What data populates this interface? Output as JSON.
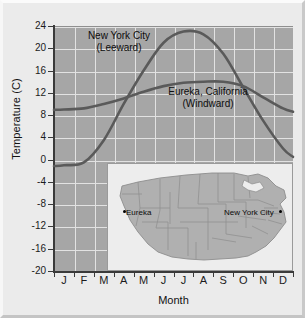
{
  "chart_data": {
    "type": "line",
    "title": "",
    "xlabel": "Month",
    "ylabel": "Temperature (C)",
    "ylim": [
      -20,
      24
    ],
    "yticks": [
      24,
      20,
      16,
      12,
      8,
      4,
      0,
      -4,
      -8,
      -12,
      -16,
      -20
    ],
    "ytick_labels": [
      "24",
      "20",
      "16",
      "12",
      "8",
      "4",
      "0",
      "-4",
      "-8",
      "-12",
      "-16",
      "-20"
    ],
    "categories": [
      "J",
      "F",
      "M",
      "A",
      "M",
      "J",
      "J",
      "A",
      "S",
      "O",
      "N",
      "D"
    ],
    "grid": true,
    "legend": "inline-annotations",
    "series": [
      {
        "name": "New York City",
        "sublabel": "(Leeward)",
        "label_full": "New York City (Leeward)",
        "color": "#5a5a5a",
        "values": [
          -1,
          -0.5,
          3.5,
          10,
          16,
          21,
          23,
          22.5,
          19,
          13,
          7,
          2
        ]
      },
      {
        "name": "Eureka, California",
        "sublabel": "(Windward)",
        "label_full": "Eureka, California (Windward)",
        "color": "#5a5a5a",
        "values": [
          9,
          9.2,
          10,
          11,
          12.2,
          13.2,
          13.8,
          14,
          14,
          13.2,
          11.2,
          9.2
        ]
      }
    ],
    "plot_background": "#a6a6a6",
    "gridline_color": "#e2e2e2",
    "figure_background": "#ebebeb"
  },
  "axes": {
    "y_title": "Temperature (C)",
    "x_title": "Month"
  },
  "annotations": {
    "nyc_line1": "New York City",
    "nyc_line2": "(Leeward)",
    "eureka_line1": "Eureka, California",
    "eureka_line2": "(Windward)"
  },
  "inset_map": {
    "region": "United States",
    "cities": [
      {
        "name": "Eureka",
        "side": "left"
      },
      {
        "name": "New York City",
        "side": "right"
      }
    ],
    "eureka_label": "Eureka",
    "nyc_label": "New York City",
    "background": "#ededed",
    "land_color": "#b0b0b0",
    "border_color": "#8d8d8d"
  }
}
